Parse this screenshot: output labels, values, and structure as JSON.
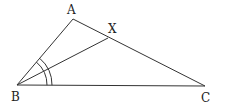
{
  "diagram": {
    "type": "geometry-triangle",
    "points": {
      "A": {
        "label": "A",
        "x": 73,
        "y": 19,
        "lx": 67,
        "ly": 14
      },
      "B": {
        "label": "B",
        "x": 17,
        "y": 85,
        "lx": 11,
        "ly": 100
      },
      "C": {
        "label": "C",
        "x": 205,
        "y": 86,
        "lx": 201,
        "ly": 101
      },
      "X": {
        "label": "X",
        "x": 108,
        "y": 38,
        "lx": 108,
        "ly": 32
      }
    },
    "segments": [
      {
        "from": "A",
        "to": "B"
      },
      {
        "from": "A",
        "to": "C"
      },
      {
        "from": "B",
        "to": "C"
      },
      {
        "from": "B",
        "to": "X"
      }
    ],
    "angle_marks": [
      {
        "vertex": "B",
        "radius": 30,
        "note": "inner arc spanning angle ABC"
      },
      {
        "vertex": "B",
        "radius": 35,
        "note": "outer arc spanning angle ABC"
      }
    ]
  }
}
